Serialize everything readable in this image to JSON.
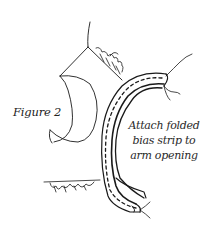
{
  "figure": {
    "label": "Figure 2",
    "caption_lines": [
      "Attach folded",
      "bias strip to",
      "arm opening"
    ]
  },
  "colors": {
    "ink": "#1a1a1a",
    "background": "#ffffff",
    "text": "#2a2a2a"
  },
  "illustration": {
    "subject": "bias strip folded around garment arm opening",
    "elements": [
      "garment-bodice-outline",
      "armhole-curve",
      "frayed-seam-allowance",
      "bias-strip",
      "stitch-line",
      "thread-ends"
    ]
  }
}
